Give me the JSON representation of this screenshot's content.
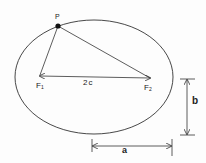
{
  "diagram": {
    "type": "ellipse-geometry",
    "colors": {
      "stroke": "#333333",
      "background": "#fdfdfd"
    },
    "ellipse": {
      "cx": 94,
      "cy": 77,
      "rx": 79,
      "ry": 57
    },
    "points": {
      "P": {
        "label": "P",
        "x": 58,
        "y": 26
      },
      "F1": {
        "label": "F",
        "sub": "1",
        "x": 40,
        "y": 75
      },
      "F2": {
        "label": "F",
        "sub": "2",
        "x": 150,
        "y": 78
      }
    },
    "labels": {
      "focal_distance": "2c",
      "semi_major": "a",
      "semi_minor": "b"
    }
  }
}
